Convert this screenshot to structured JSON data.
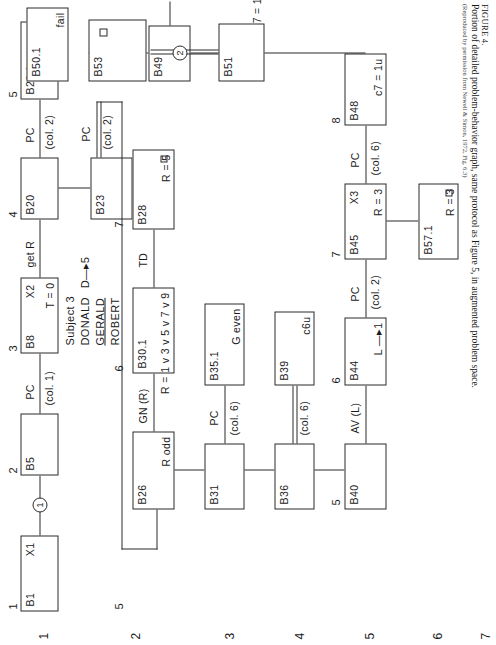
{
  "figure": {
    "caption_label": "FIGURE 4.",
    "caption_line1": "Portion of detailed problem-behavior graph, same protocol as Figure 5, in augmented problem space.",
    "caption_line2": "(Reproduced by permission from Newell & Simon, 1972, Fig. 6.3)"
  },
  "subject": {
    "line1": "Subject 3",
    "line2_name": "DONALD",
    "line2_assign": "D—▸5",
    "line3": "GERALD",
    "line4": "ROBERT"
  },
  "row_labels": [
    "1",
    "2",
    "3",
    "4",
    "5",
    "6",
    "7"
  ],
  "column_numbers": {
    "r1c1": "1",
    "r1c2": "2",
    "r1c3": "3",
    "r1c4": "4",
    "r1c5": "5",
    "r2c5": "5",
    "r2c6": "6",
    "r2c7": "7",
    "r5c5": "5",
    "r5c6": "6",
    "r5c7": "7",
    "r5c8": "8",
    "r5c9": "9",
    "r5c10": "10"
  },
  "nodes": [
    {
      "id": "B1",
      "label": "B1",
      "aux": "X1",
      "state": "",
      "row": 1
    },
    {
      "id": "B5",
      "label": "B5",
      "aux": "",
      "state": "",
      "row": 1
    },
    {
      "id": "B8",
      "label": "B8",
      "aux": "X2",
      "state": "T = 0",
      "row": 1
    },
    {
      "id": "B20",
      "label": "B20",
      "aux": "",
      "state": "",
      "row": 1
    },
    {
      "id": "B22.1",
      "label": "B22.1",
      "aux": "",
      "state": "R odd",
      "row": 1
    },
    {
      "id": "B23",
      "label": "B23",
      "aux": "",
      "state": "",
      "row": 2
    },
    {
      "id": "B26",
      "label": "B26",
      "aux": "",
      "state": "R odd",
      "row": 2
    },
    {
      "id": "B30.1",
      "label": "B30.1",
      "aux": "",
      "state": "R = 1 v 3 v 5 v 7 v 9",
      "row": 2
    },
    {
      "id": "B28",
      "label": "B28",
      "aux": "",
      "state": "R = 5",
      "row": 2,
      "box_flag": true
    },
    {
      "id": "B31",
      "label": "B31",
      "aux": "",
      "state": "",
      "row": 3
    },
    {
      "id": "B35.1",
      "label": "B35.1",
      "aux": "",
      "state": "G even",
      "row": 3
    },
    {
      "id": "B36",
      "label": "B36",
      "aux": "",
      "state": "",
      "row": 4
    },
    {
      "id": "B39",
      "label": "B39",
      "aux": "",
      "state": "c6u",
      "row": 4
    },
    {
      "id": "B40",
      "label": "B40",
      "aux": "",
      "state": "",
      "row": 5
    },
    {
      "id": "B44",
      "label": "B44",
      "aux": "",
      "state": "L —▸1",
      "row": 5
    },
    {
      "id": "B45",
      "label": "B45",
      "aux": "X3",
      "state": "R = 3",
      "row": 5
    },
    {
      "id": "B48",
      "label": "B48",
      "aux": "",
      "state": "c7 = 1u",
      "row": 5
    },
    {
      "id": "B49",
      "label": "B49",
      "aux": "",
      "state": "",
      "row": 5
    },
    {
      "id": "B50.1",
      "label": "B50.1",
      "aux": "",
      "state": "fail",
      "row": 5
    },
    {
      "id": "B51",
      "label": "B51",
      "aux": "",
      "state": "",
      "row": 6
    },
    {
      "id": "B53",
      "label": "B53",
      "aux": "",
      "state": "",
      "row": 6,
      "box_flag": true
    },
    {
      "id": "B57.1",
      "label": "B57.1",
      "aux": "",
      "state": "R = 3",
      "row": 6,
      "box_flag": true
    }
  ],
  "operators": [
    {
      "from": "B1",
      "to": "B5",
      "name": "",
      "col": "",
      "marker": "1"
    },
    {
      "from": "B5",
      "to": "B8",
      "name": "PC",
      "col": "(col. 1)"
    },
    {
      "from": "B8",
      "to": "B20",
      "name": "get R",
      "col": ""
    },
    {
      "from": "B20",
      "to": "B22.1",
      "name": "PC",
      "col": "(col. 2)"
    },
    {
      "from": "B23",
      "to": "wrap",
      "name": "PC",
      "col": "(col. 2)"
    },
    {
      "from": "B26",
      "to": "B30.1",
      "name": "GN (R)",
      "col": ""
    },
    {
      "from": "B30.1",
      "to": "B28",
      "name": "TD",
      "col": ""
    },
    {
      "from": "B31",
      "to": "B35.1",
      "name": "PC",
      "col": "(col. 6)"
    },
    {
      "from": "B36",
      "to": "B39",
      "name": "",
      "col": "(col. 6)"
    },
    {
      "from": "B40",
      "to": "B44",
      "name": "AV (L)",
      "col": ""
    },
    {
      "from": "B44",
      "to": "B45",
      "name": "PC",
      "col": "(col. 2)"
    },
    {
      "from": "B45",
      "to": "B48",
      "name": "PC",
      "col": "(col. 6)"
    },
    {
      "from": "B48",
      "to": "B49",
      "name": "get c7 = 1",
      "col": ""
    },
    {
      "from": "B49",
      "to": "B50.1",
      "name": "",
      "col": "",
      "marker": "2"
    },
    {
      "from": "B51",
      "to": "B53",
      "name": "",
      "col": "",
      "marker": "2"
    }
  ],
  "markers": {
    "one": "1",
    "two": "2"
  }
}
